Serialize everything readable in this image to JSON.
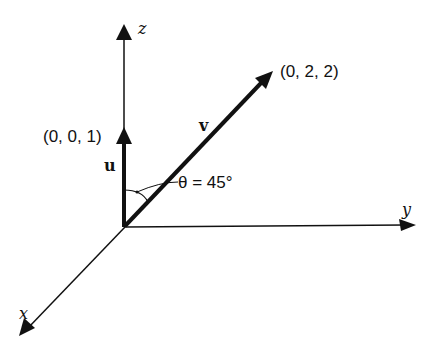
{
  "diagram": {
    "type": "3d-vector-diagram",
    "axes": {
      "x": {
        "label": "x"
      },
      "y": {
        "label": "y"
      },
      "z": {
        "label": "z"
      }
    },
    "vectors": [
      {
        "name": "u",
        "endpoint_label": "(0, 0, 1)",
        "components": [
          0,
          0,
          1
        ]
      },
      {
        "name": "v",
        "endpoint_label": "(0, 2, 2)",
        "components": [
          0,
          2,
          2
        ]
      }
    ],
    "angle": {
      "label": "θ = 45°",
      "between": [
        "u",
        "v"
      ]
    }
  },
  "colors": {
    "ink": "#111111",
    "background": "#ffffff"
  }
}
